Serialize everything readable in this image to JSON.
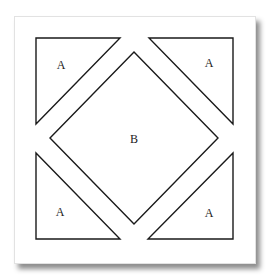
{
  "diagram": {
    "title": "",
    "colors": {
      "stroke": "#1a1a1a",
      "fill": "#ffffff",
      "card_border": "#e2e2e2"
    },
    "pieces": [
      {
        "id": "top-left-triangle",
        "label": "A",
        "points": "36,38 120,38 36,124",
        "label_pos": [
          61,
          66
        ]
      },
      {
        "id": "top-right-triangle",
        "label": "A",
        "points": "149,38 233,38 233,124",
        "label_pos": [
          209,
          64
        ]
      },
      {
        "id": "bottom-left-triangle",
        "label": "A",
        "points": "36,153 36,239 120,239",
        "label_pos": [
          60,
          213
        ]
      },
      {
        "id": "bottom-right-triangle",
        "label": "A",
        "points": "233,153 233,239 148,239",
        "label_pos": [
          209,
          214
        ]
      },
      {
        "id": "center-square",
        "label": "B",
        "points": "134,52 218,138 134,224 50,138",
        "label_pos": [
          134,
          140
        ]
      }
    ]
  }
}
